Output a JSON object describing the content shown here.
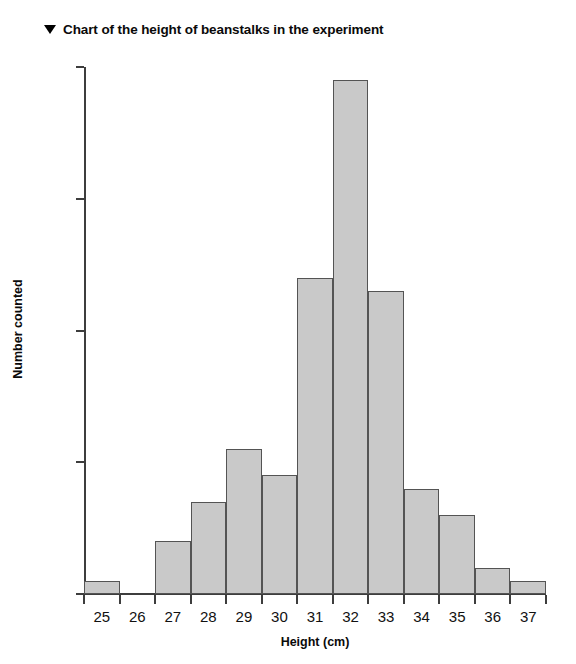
{
  "header": {
    "marker_icon": "triangle-down-icon",
    "title": "Chart of the height of beanstalks in the experiment"
  },
  "chart_data": {
    "type": "bar",
    "title": "Chart of the height of beanstalks in the experiment",
    "xlabel": "Height (cm)",
    "ylabel": "Number counted",
    "categories": [
      "25",
      "26",
      "27",
      "28",
      "29",
      "30",
      "31",
      "32",
      "33",
      "34",
      "35",
      "36",
      "37"
    ],
    "values": [
      1,
      0,
      4,
      7,
      11,
      9,
      24,
      39,
      23,
      8,
      6,
      2,
      1
    ],
    "xtick_labels": [
      "25",
      "26",
      "27",
      "28",
      "29",
      "30",
      "31",
      "32",
      "33",
      "34",
      "35",
      "36",
      "37"
    ],
    "ytick_labels": [
      "0",
      "10",
      "20",
      "30",
      "40"
    ],
    "ytick_values": [
      0,
      10,
      20,
      30,
      40
    ],
    "ylim": [
      0,
      40
    ],
    "grid": false,
    "legend": false,
    "bar_fill_color": "#c9c9c9",
    "bar_border_color": "#545454",
    "axis_color": "#3d3d3d"
  }
}
